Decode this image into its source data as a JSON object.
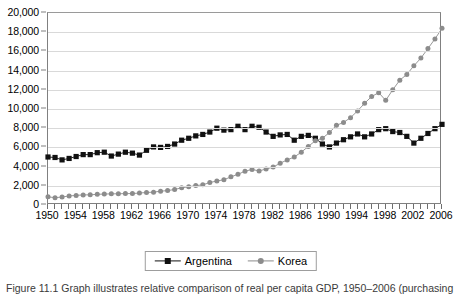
{
  "chart_data": {
    "type": "line",
    "title": "",
    "subtitle": "",
    "xlabel": "",
    "ylabel": "",
    "xlim": [
      1950,
      2006
    ],
    "ylim": [
      0,
      20000
    ],
    "grid": true,
    "legend_position": "bottom-center",
    "y_ticks": [
      0,
      2000,
      4000,
      6000,
      8000,
      10000,
      12000,
      14000,
      16000,
      18000,
      20000
    ],
    "y_tick_labels": [
      "0",
      "2,000",
      "4,000",
      "6,000",
      "8,000",
      "10,000",
      "12,000",
      "14,000",
      "16,000",
      "18,000",
      "20,000"
    ],
    "x_ticks": [
      1950,
      1951,
      1952,
      1953,
      1954,
      1955,
      1956,
      1957,
      1958,
      1959,
      1960,
      1961,
      1962,
      1963,
      1964,
      1965,
      1966,
      1967,
      1968,
      1969,
      1970,
      1971,
      1972,
      1973,
      1974,
      1975,
      1976,
      1977,
      1978,
      1979,
      1980,
      1981,
      1982,
      1983,
      1984,
      1985,
      1986,
      1987,
      1988,
      1989,
      1990,
      1991,
      1992,
      1993,
      1994,
      1995,
      1996,
      1997,
      1998,
      1999,
      2000,
      2001,
      2002,
      2003,
      2004,
      2005,
      2006
    ],
    "x_tick_labels": [
      "1950",
      "1954",
      "1958",
      "1962",
      "1966",
      "1970",
      "1974",
      "1978",
      "1982",
      "1986",
      "1990",
      "1994",
      "1998",
      "2002",
      "2006"
    ],
    "x_tick_label_values": [
      1950,
      1954,
      1958,
      1962,
      1966,
      1970,
      1974,
      1978,
      1982,
      1986,
      1990,
      1994,
      1998,
      2002,
      2006
    ],
    "x": [
      1950,
      1951,
      1952,
      1953,
      1954,
      1955,
      1956,
      1957,
      1958,
      1959,
      1960,
      1961,
      1962,
      1963,
      1964,
      1965,
      1966,
      1967,
      1968,
      1969,
      1970,
      1971,
      1972,
      1973,
      1974,
      1975,
      1976,
      1977,
      1978,
      1979,
      1980,
      1981,
      1982,
      1983,
      1984,
      1985,
      1986,
      1987,
      1988,
      1989,
      1990,
      1991,
      1992,
      1993,
      1994,
      1995,
      1996,
      1997,
      1998,
      1999,
      2000,
      2001,
      2002,
      2003,
      2004,
      2005,
      2006
    ],
    "series": [
      {
        "name": "Argentina",
        "marker": "square",
        "color": "#111111",
        "values": [
          5000,
          4950,
          4700,
          4850,
          5050,
          5250,
          5250,
          5450,
          5500,
          5100,
          5300,
          5500,
          5400,
          5200,
          5700,
          6050,
          6000,
          6100,
          6350,
          6750,
          6950,
          7200,
          7350,
          7600,
          8000,
          7800,
          7850,
          8200,
          7850,
          8200,
          8100,
          7600,
          7150,
          7300,
          7350,
          6750,
          7150,
          7250,
          6950,
          6350,
          6050,
          6450,
          6800,
          7100,
          7400,
          7100,
          7400,
          7850,
          7950,
          7650,
          7550,
          7150,
          6450,
          6950,
          7450,
          7950,
          8400
        ],
        "values_note": "GDP per capita, Argentina"
      },
      {
        "name": "Korea",
        "marker": "circle",
        "color": "#8c8c8c",
        "values": [
          850,
          760,
          830,
          940,
          1000,
          1050,
          1060,
          1110,
          1140,
          1160,
          1170,
          1190,
          1190,
          1250,
          1300,
          1340,
          1440,
          1500,
          1620,
          1790,
          1900,
          2020,
          2100,
          2340,
          2500,
          2630,
          2930,
          3200,
          3520,
          3700,
          3550,
          3750,
          3950,
          4350,
          4700,
          5000,
          5500,
          6100,
          6700,
          6950,
          7550,
          8300,
          8600,
          9100,
          9800,
          10600,
          11300,
          11700,
          10900,
          12000,
          13000,
          13600,
          14500,
          15300,
          16300,
          17300,
          18400
        ],
        "values_note": "GDP per capita, Korea"
      }
    ]
  },
  "legend": {
    "entries": [
      {
        "label": "Argentina",
        "marker": "square-marker",
        "color": "#111111"
      },
      {
        "label": "Korea",
        "marker": "circle-marker",
        "color": "#8c8c8c"
      }
    ]
  },
  "caption": {
    "text": "Figure 11.1 Graph illustrates relative comparison of real per capita GDP, 1950–2006 (purchasing"
  }
}
